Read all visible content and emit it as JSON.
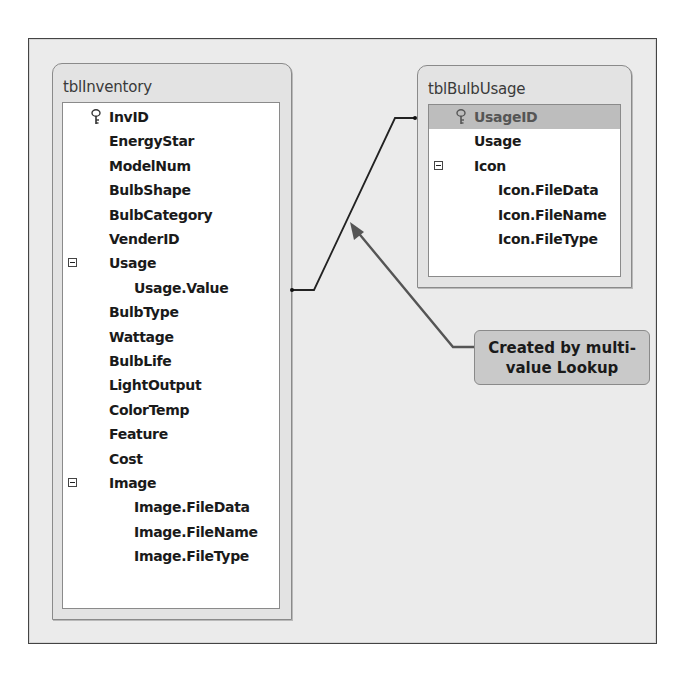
{
  "diagram": {
    "tables": [
      {
        "name": "tblInventory",
        "fields": [
          {
            "label": "InvID",
            "level": 0,
            "primary_key": true
          },
          {
            "label": "EnergyStar",
            "level": 0
          },
          {
            "label": "ModelNum",
            "level": 0
          },
          {
            "label": "BulbShape",
            "level": 0
          },
          {
            "label": "BulbCategory",
            "level": 0
          },
          {
            "label": "VenderID",
            "level": 0
          },
          {
            "label": "Usage",
            "level": 0,
            "expandable": true
          },
          {
            "label": "Usage.Value",
            "level": 1
          },
          {
            "label": "BulbType",
            "level": 0
          },
          {
            "label": "Wattage",
            "level": 0
          },
          {
            "label": "BulbLife",
            "level": 0
          },
          {
            "label": "LightOutput",
            "level": 0
          },
          {
            "label": "ColorTemp",
            "level": 0
          },
          {
            "label": "Feature",
            "level": 0
          },
          {
            "label": "Cost",
            "level": 0
          },
          {
            "label": "Image",
            "level": 0,
            "expandable": true
          },
          {
            "label": "Image.FileData",
            "level": 1
          },
          {
            "label": "Image.FileName",
            "level": 1
          },
          {
            "label": "Image.FileType",
            "level": 1
          }
        ]
      },
      {
        "name": "tblBulbUsage",
        "fields": [
          {
            "label": "UsageID",
            "level": 0,
            "primary_key": true,
            "selected": true
          },
          {
            "label": "Usage",
            "level": 0
          },
          {
            "label": "Icon",
            "level": 0,
            "expandable": true
          },
          {
            "label": "Icon.FileData",
            "level": 1
          },
          {
            "label": "Icon.FileName",
            "level": 1
          },
          {
            "label": "Icon.FileType",
            "level": 1
          }
        ]
      }
    ],
    "relationship": {
      "from": "tblInventory.Usage.Value",
      "to": "tblBulbUsage.UsageID"
    },
    "callout": {
      "line1": "Created by multi-",
      "line2": "value Lookup"
    },
    "colors": {
      "frame_bg": "#ebebeb",
      "table_bg": "#e3e3e3",
      "selected_row": "#bdbdbd",
      "callout_bg": "#c9c9c9",
      "arrow": "#555555",
      "line": "#222222"
    }
  }
}
